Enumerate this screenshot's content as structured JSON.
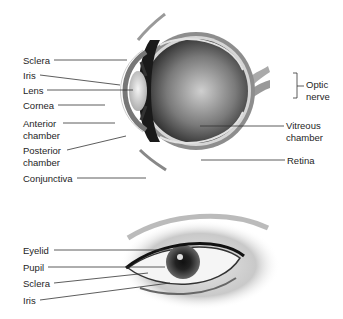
{
  "diagram": {
    "cross_section": {
      "labels": {
        "sclera": "Sclera",
        "iris": "Iris",
        "lens": "Lens",
        "cornea": "Cornea",
        "anterior_1": "Anterior",
        "anterior_2": "chamber",
        "posterior_1": "Posterior",
        "posterior_2": "chamber",
        "conjunctiva": "Conjunctiva",
        "optic_1": "Optic",
        "optic_2": "nerve",
        "vitreous_1": "Vitreous",
        "vitreous_2": "chamber",
        "retina": "Retina"
      }
    },
    "external_eye": {
      "labels": {
        "eyelid": "Eyelid",
        "pupil": "Pupil",
        "sclera": "Sclera",
        "iris": "Iris"
      }
    }
  }
}
